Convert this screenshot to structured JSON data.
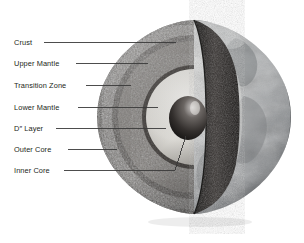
{
  "figure": {
    "background_color": "#ffffff",
    "label_color": "#231f20",
    "leader_line_color": "#3a3a3a"
  },
  "labels": [
    {
      "id": "crust",
      "text": "Crust",
      "x": 14,
      "y": 38,
      "leader_x1": 44,
      "leader_x2": 176,
      "leader_y": 42
    },
    {
      "id": "upper-mantle",
      "text": "Upper Mantle",
      "x": 14,
      "y": 59,
      "leader_x1": 76,
      "leader_x2": 148,
      "leader_y": 63
    },
    {
      "id": "transition-zone",
      "text": "Transition Zone",
      "x": 14,
      "y": 81,
      "leader_x1": 86,
      "leader_x2": 131,
      "leader_y": 85
    },
    {
      "id": "lower-mantle",
      "text": "Lower Mantle",
      "x": 14,
      "y": 103,
      "leader_x1": 78,
      "leader_x2": 158,
      "leader_y": 107
    },
    {
      "id": "d-layer",
      "text": "D″ Layer",
      "x": 14,
      "y": 124,
      "leader_x1": 56,
      "leader_x2": 166,
      "leader_y": 128
    },
    {
      "id": "outer-core",
      "text": "Outer Core",
      "x": 14,
      "y": 145,
      "leader_x1": 68,
      "leader_x2": 117,
      "leader_y": 149
    },
    {
      "id": "inner-core",
      "text": "Inner Core",
      "x": 14,
      "y": 166,
      "leader_x1": 64,
      "leader_x2": 175,
      "leader_y": 170
    }
  ],
  "globe": {
    "center_x": 194,
    "center_y": 117,
    "radius": 97,
    "layers": [
      {
        "name": "surface",
        "tone": "#b9bcbe"
      },
      {
        "name": "crust",
        "tone": "#3e3a38"
      },
      {
        "name": "upper-mantle",
        "tone": "#6e6a66"
      },
      {
        "name": "transition-zone",
        "tone": "#514d4a"
      },
      {
        "name": "lower-mantle",
        "tone": "#777370"
      },
      {
        "name": "d-layer",
        "tone": "#3c3936"
      },
      {
        "name": "outer-core",
        "tone": "#e8e6e1"
      },
      {
        "name": "inner-core",
        "tone": "#2b2826"
      }
    ]
  }
}
